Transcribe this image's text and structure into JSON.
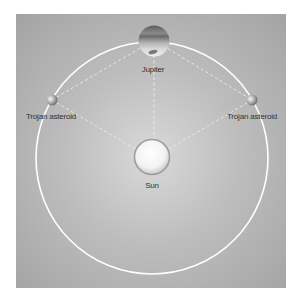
{
  "diagram": {
    "labels": {
      "jupiter": "Jupiter",
      "trojan_left": "Trojan asteroid",
      "trojan_right": "Trojan asteroid",
      "sun": "Sun"
    },
    "colors": {
      "background": "#ffffff",
      "panel": "#b5b5b5",
      "orbit": "#ffffff",
      "dashed_lines": "#e6e6e6",
      "text": "#333333"
    }
  }
}
